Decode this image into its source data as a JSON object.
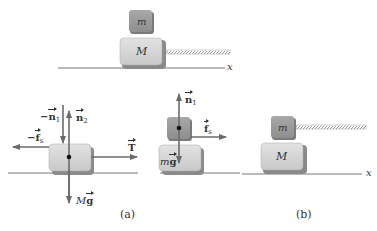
{
  "figure": {
    "top": {
      "small_block_label": "m",
      "large_block_label": "M",
      "axis_label": "x"
    },
    "part_a": {
      "caption": "(a)",
      "large_block_fbd": {
        "forces": {
          "neg_n1": {
            "prefix": "−",
            "symbol": "n",
            "subscript": "1"
          },
          "n2": {
            "symbol": "n",
            "subscript": "2"
          },
          "neg_fs": {
            "prefix": "−",
            "symbol": "f",
            "subscript": "s"
          },
          "T": {
            "symbol": "T"
          },
          "Mg": {
            "mass": "M",
            "symbol": "g"
          }
        }
      },
      "small_block_fbd": {
        "forces": {
          "n1": {
            "symbol": "n",
            "subscript": "1"
          },
          "fs": {
            "symbol": "f",
            "subscript": "s"
          },
          "mg": {
            "mass": "m",
            "symbol": "g"
          }
        }
      }
    },
    "part_b": {
      "caption": "(b)",
      "small_block_label": "m",
      "large_block_label": "M",
      "axis_label": "x"
    },
    "colors": {
      "small_block": "#9a9a9a",
      "large_block": "#d4d4d4",
      "block_shadow": "#8a8a8a",
      "arrow": "#6b6b6b",
      "ground": "#777777"
    }
  }
}
